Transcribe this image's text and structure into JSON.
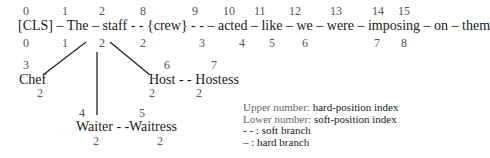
{
  "sentence": {
    "upper": [
      "0",
      "1",
      "2",
      "8",
      "9",
      "10",
      "11",
      "12",
      "13",
      "14",
      "15"
    ],
    "line": "[CLS] – The – staff - - {crew} - - – acted – like – we – were – imposing – on – them",
    "lower": [
      "0",
      "1",
      "2",
      "2",
      "3",
      "4",
      "5",
      "6",
      "7",
      "8",
      "9"
    ]
  },
  "nodes": {
    "chef": {
      "word": "Chef",
      "upper": "3",
      "lower": "2"
    },
    "waiter": {
      "word": "Waiter - -",
      "upper": "4",
      "lower": "2"
    },
    "waitress": {
      "word": "Waitress",
      "upper": "5",
      "lower": "2"
    },
    "host": {
      "word": "Host - - Hostess",
      "upper_host": "6",
      "upper_hostess": "7",
      "lower_host": "2",
      "lower_hostess": "2"
    }
  },
  "legend": {
    "l1_muted": "Upper number:",
    "l1_text": "hard-position index",
    "l2_muted": "Lower number:",
    "l2_text": "soft-position index",
    "l3": "- - : soft branch",
    "l4": "– : hard branch"
  }
}
